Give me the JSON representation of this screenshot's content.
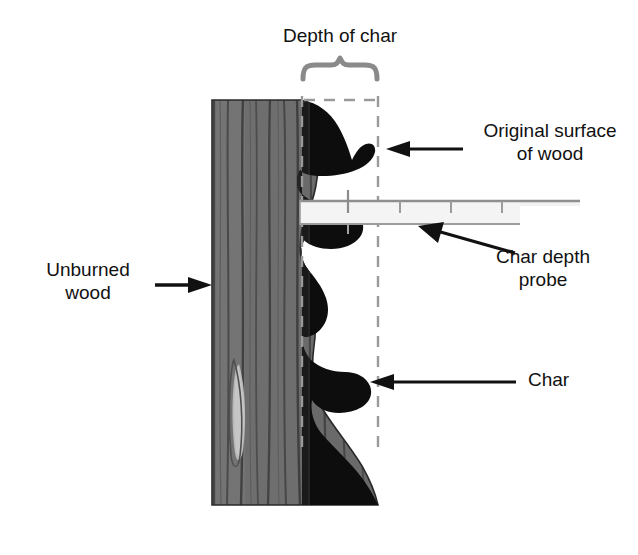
{
  "figure": {
    "background_color": "#ffffff"
  },
  "labels": {
    "depth_of_char": "Depth of char",
    "original_surface_of_wood": "Original surface\nof wood",
    "char_depth_probe": "Char depth\nprobe",
    "unburned_wood": "Unburned\nwood",
    "char": "Char"
  },
  "colors": {
    "wood_fill": "#6e6e6e",
    "wood_grain": "#3f3f3f",
    "wood_knot": "#b9b9b9",
    "char_fill": "#0d0d0d",
    "outline": "#1a1a1a",
    "dashed_line": "#9a9a9a",
    "brace": "#8a8a8a",
    "probe_fill": "#f2f2f2",
    "probe_edge": "#8f8f8f",
    "text": "#111111"
  },
  "elements": {
    "wood_block": {
      "name": "unburned-wood-block",
      "description": "Gray vertical-grained wood block with elongated light knot",
      "x": 212,
      "y": 100,
      "width": 166,
      "height": 405
    },
    "char_layer": {
      "name": "char-layer",
      "description": "Black scalloped charred zone on right face of wood",
      "lobe_count": 5
    },
    "char_depth_probe": {
      "name": "char-depth-probe",
      "description": "Light horizontal graduated probe bar inserted into char",
      "x": 300,
      "y": 199,
      "length": 280,
      "tick_count": 5
    },
    "depth_brace": {
      "name": "depth-of-char-brace",
      "description": "Curly brace spanning the char depth",
      "x_start": 302,
      "x_end": 378,
      "y": 62
    },
    "dashed_guides": {
      "name": "char-depth-dashed-guides",
      "vertical_left_x": 302,
      "vertical_right_x": 378,
      "horizontal_y": 100
    }
  },
  "arrows": [
    {
      "name": "arrow-original-surface",
      "points_to": "original surface line",
      "direction": "left"
    },
    {
      "name": "arrow-char-depth-probe",
      "points_to": "probe bar",
      "direction": "up-left"
    },
    {
      "name": "arrow-unburned-wood",
      "points_to": "wood block",
      "direction": "right"
    },
    {
      "name": "arrow-char",
      "points_to": "char layer",
      "direction": "left"
    }
  ]
}
